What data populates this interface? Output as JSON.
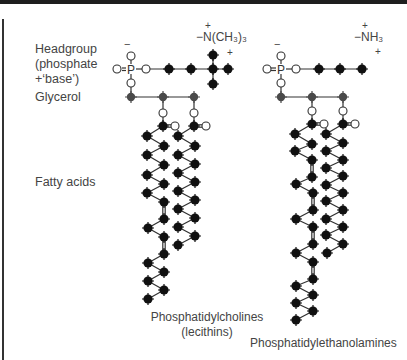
{
  "row_labels": {
    "headgroup_line1": "Headgroup",
    "headgroup_line2": "(phosphate",
    "headgroup_line3": "+‘base’)",
    "glycerol": "Glycerol",
    "fatty_acids": "Fatty acids"
  },
  "molecules": [
    {
      "name": "Phosphatidylcholines",
      "subname": "(lecithins)",
      "base_group": "−N(CH₃)₃",
      "base_charge": "+",
      "phosphate_charge": "−"
    },
    {
      "name": "Phosphatidylethanolamines",
      "subname": "",
      "base_group": "−NH₃",
      "base_charge": "+",
      "phosphate_charge": "−"
    }
  ],
  "atoms": {
    "phosphorus": "P",
    "double_bond_o": "O="
  },
  "colors": {
    "carbon": "#111111",
    "bond": "#333333",
    "oxygen_stroke": "#333333",
    "glycerol_carbon": "#444444",
    "text": "#444444"
  }
}
